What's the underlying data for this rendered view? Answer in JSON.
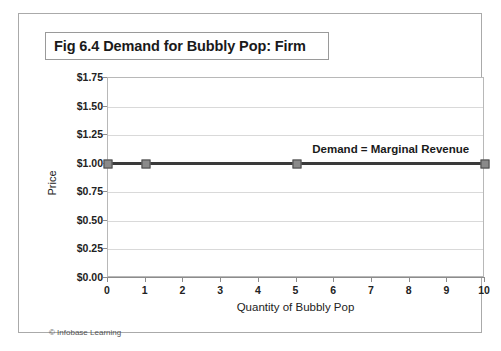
{
  "figure": {
    "title": "Fig 6.4 Demand for Bubbly Pop: Firm",
    "footer": "© Infobase Learning"
  },
  "chart_data": {
    "type": "line",
    "title": "Fig 6.4 Demand for Bubbly Pop: Firm",
    "xlabel": "Quantity of Bubbly Pop",
    "ylabel": "Price",
    "xlim": [
      0,
      10
    ],
    "ylim": [
      0,
      1.75
    ],
    "grid": true,
    "legend_position": "none",
    "x_ticks": [
      "0",
      "1",
      "2",
      "3",
      "4",
      "5",
      "6",
      "7",
      "8",
      "9",
      "10"
    ],
    "x_tick_values": [
      0,
      1,
      2,
      3,
      4,
      5,
      6,
      7,
      8,
      9,
      10
    ],
    "y_ticks": [
      "$0.00",
      "$0.25",
      "$0.50",
      "$0.75",
      "$1.00",
      "$1.25",
      "$1.50",
      "$1.75"
    ],
    "y_tick_values": [
      0,
      0.25,
      0.5,
      0.75,
      1.0,
      1.25,
      1.5,
      1.75
    ],
    "series": [
      {
        "name": "Demand = Marginal Revenue",
        "x": [
          0,
          1,
          5,
          10
        ],
        "values": [
          1.0,
          1.0,
          1.0,
          1.0
        ],
        "marker": "square",
        "marker_color": "#8a8a8a",
        "line_color": "#3a3a3a"
      }
    ],
    "annotations": [
      {
        "text": "Demand = Marginal Revenue",
        "x": 7.5,
        "y": 1.13
      }
    ]
  }
}
